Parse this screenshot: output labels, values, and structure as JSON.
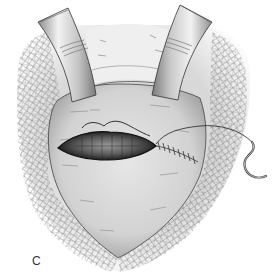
{
  "figure": {
    "panel_label": "C",
    "elements": {
      "retractors": [
        {
          "name": "left-retractor",
          "side": "left"
        },
        {
          "name": "right-retractor",
          "side": "right"
        }
      ],
      "draping": "gauze-mesh",
      "incision": "elliptical incision partially sutured",
      "suture": "running suture with curved needle"
    },
    "colors": {
      "background": "#ffffff",
      "tissue": "#d9d9d9",
      "tissue_shadow": "#a8a8a8",
      "mesh_line": "#555555",
      "retractor_light": "#e8e8e8",
      "retractor_dark": "#9a9a9a",
      "incision_dark": "#1a1a1a",
      "line": "#333333"
    }
  }
}
